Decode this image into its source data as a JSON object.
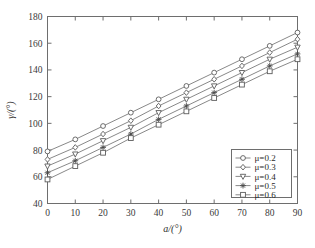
{
  "chart_data": {
    "type": "line",
    "title": "",
    "xlabel": "a/(°)",
    "ylabel": "γ/(°)",
    "xlim": [
      0,
      90
    ],
    "ylim": [
      40,
      180
    ],
    "xticks": [
      0,
      10,
      20,
      30,
      40,
      50,
      60,
      70,
      80,
      90
    ],
    "yticks": [
      40,
      60,
      80,
      100,
      120,
      140,
      160,
      180
    ],
    "grid": false,
    "legend_position": "lower-right",
    "x": [
      0,
      10,
      20,
      30,
      40,
      50,
      60,
      70,
      80,
      90
    ],
    "series": [
      {
        "name": "μ=0.2",
        "marker": "circle",
        "values": [
          79,
          88,
          98,
          108,
          118,
          128,
          138,
          148,
          158,
          168
        ]
      },
      {
        "name": "μ=0.3",
        "marker": "diamond",
        "values": [
          73,
          82,
          92,
          102,
          113,
          123,
          133,
          143,
          153,
          163
        ]
      },
      {
        "name": "μ=0.4",
        "marker": "triangle-down",
        "values": [
          68,
          77,
          87,
          97,
          108,
          118,
          128,
          138,
          148,
          157
        ]
      },
      {
        "name": "μ=0.5",
        "marker": "asterisk",
        "values": [
          63,
          72,
          82,
          92,
          103,
          113,
          123,
          133,
          143,
          152
        ]
      },
      {
        "name": "μ=0.6",
        "marker": "square",
        "values": [
          58,
          68,
          78,
          89,
          99,
          109,
          119,
          129,
          139,
          148
        ]
      }
    ]
  },
  "legend": {
    "items": [
      {
        "label": "μ=0.2"
      },
      {
        "label": "μ=0.3"
      },
      {
        "label": "μ=0.4"
      },
      {
        "label": "μ=0.5"
      },
      {
        "label": "μ=0.6"
      }
    ]
  },
  "axes": {
    "x_title": "a/(°)",
    "y_title": "γ/(°)",
    "x_tick_labels": [
      "0",
      "10",
      "20",
      "30",
      "40",
      "50",
      "60",
      "70",
      "80",
      "90"
    ],
    "y_tick_labels": [
      "40",
      "60",
      "80",
      "100",
      "120",
      "140",
      "160",
      "180"
    ]
  },
  "colors": {
    "axis": "#6e6e6e",
    "line": "#7a7a7a",
    "marker_edge": "#5c5c5c",
    "marker_fill": "#ffffff",
    "text": "#2e2e2e",
    "background": "#ffffff"
  }
}
